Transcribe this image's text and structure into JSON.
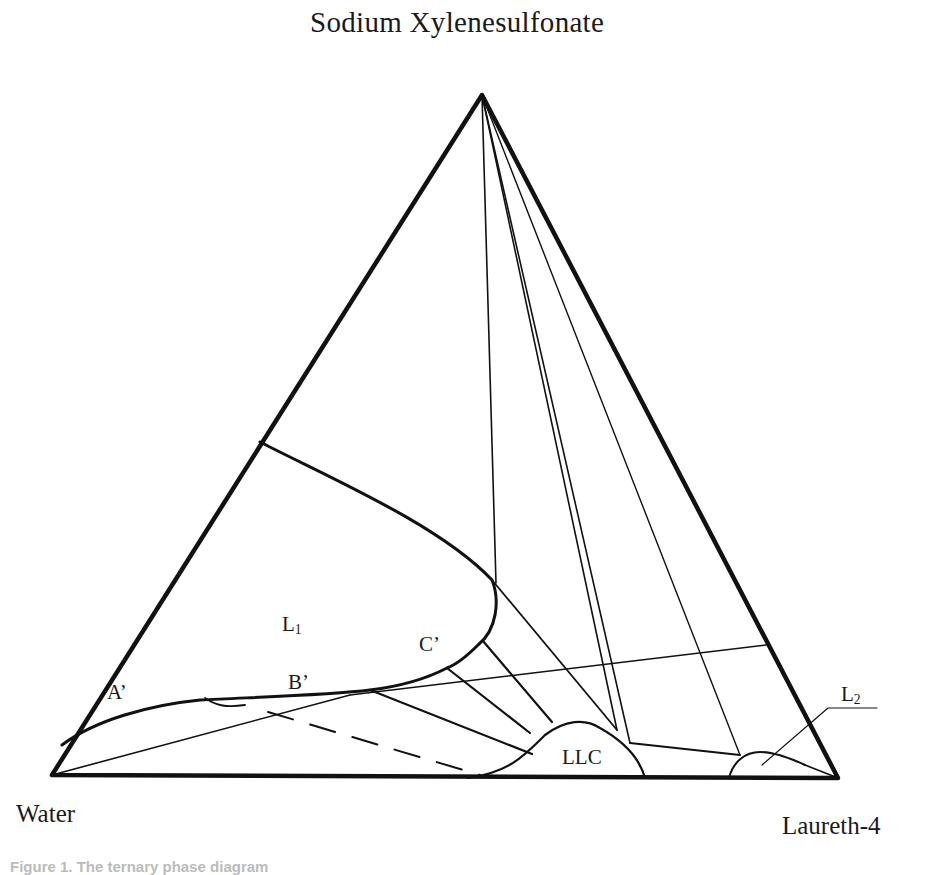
{
  "figure": {
    "type": "ternary_phase_diagram",
    "vertices": {
      "top": "Sodium Xylenesulfonate",
      "bottom_left": "Water",
      "bottom_right": "Laureth-4"
    },
    "regions": {
      "l1": {
        "main": "L",
        "sub": "1"
      },
      "l2": {
        "main": "L",
        "sub": "2"
      },
      "llc": "LLC"
    },
    "points": {
      "a": "A’",
      "b": "B’",
      "c": "C’"
    },
    "caption": "Figure 1. The ternary phase diagram",
    "colors": {
      "line": "#111111",
      "background": "#ffffff"
    }
  }
}
